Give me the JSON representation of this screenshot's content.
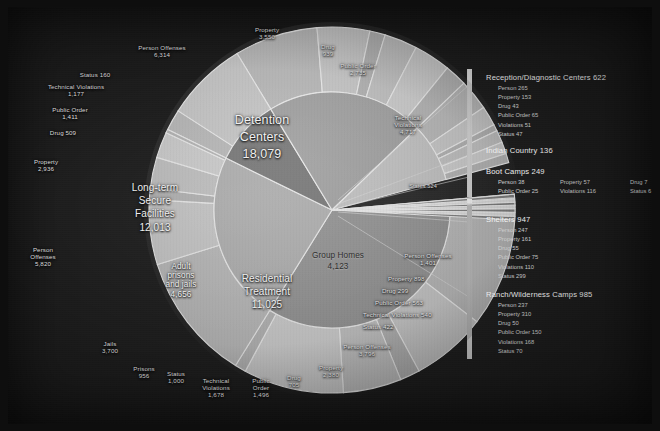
{
  "chart_data": {
    "type": "pie",
    "title": "",
    "subtitle": "",
    "layout": "nested donut: inner ring = facility type, outer ring = offense breakdown",
    "legend_position": "right",
    "grid": false,
    "inner_ring": [
      {
        "label": "Detention Centers",
        "value": 18079,
        "value_text": "18,079",
        "color": "#8d8d8d"
      },
      {
        "label": "Long-term Secure Facilities",
        "value": 12013,
        "value_text": "12,013",
        "color": "#a9a9a9"
      },
      {
        "label": "Adult prisons and jails",
        "value": 4656,
        "value_text": "4,656",
        "color": "#6f6f6f"
      },
      {
        "label": "Residential Treatment",
        "value": 11025,
        "value_text": "11,025",
        "color": "#9b9b9b"
      },
      {
        "label": "Group Homes",
        "value": 4123,
        "value_text": "4,123",
        "color": "#bdbdbd"
      }
    ],
    "outer_ring": [
      {
        "label": "Person Offenses",
        "value": 6314,
        "value_text": "6,314",
        "parent": "Detention Centers"
      },
      {
        "label": "Property",
        "value": 3550,
        "value_text": "3,550",
        "parent": "Detention Centers"
      },
      {
        "label": "Drug",
        "value": 939,
        "value_text": "939",
        "parent": "Detention Centers"
      },
      {
        "label": "Public Order",
        "value": 2735,
        "value_text": "2,735",
        "parent": "Detention Centers"
      },
      {
        "label": "Technical Violations",
        "value": 4717,
        "value_text": "4,717",
        "parent": "Detention Centers"
      },
      {
        "label": "Status",
        "value": 524,
        "value_text": "524",
        "parent": "Detention Centers"
      },
      {
        "label": "Person Offenses",
        "value": 1401,
        "value_text": "1,401",
        "parent": "Group Homes"
      },
      {
        "label": "Property",
        "value": 898,
        "value_text": "898",
        "parent": "Group Homes"
      },
      {
        "label": "Drug",
        "value": 299,
        "value_text": "299",
        "parent": "Group Homes"
      },
      {
        "label": "Public Order",
        "value": 563,
        "value_text": "563",
        "parent": "Group Homes"
      },
      {
        "label": "Technical Violations",
        "value": 540,
        "value_text": "540",
        "parent": "Group Homes"
      },
      {
        "label": "Status",
        "value": 422,
        "value_text": "422",
        "parent": "Group Homes"
      },
      {
        "label": "Person Offenses",
        "value": 3796,
        "value_text": "3,796",
        "parent": "Residential Treatment"
      },
      {
        "label": "Property",
        "value": 2380,
        "value_text": "2,380",
        "parent": "Residential Treatment"
      },
      {
        "label": "Drug",
        "value": 705,
        "value_text": "705",
        "parent": "Residential Treatment"
      },
      {
        "label": "Public Order",
        "value": 1496,
        "value_text": "1,496",
        "parent": "Residential Treatment"
      },
      {
        "label": "Technical Violations",
        "value": 1678,
        "value_text": "1,678",
        "parent": "Residential Treatment"
      },
      {
        "label": "Status",
        "value": 1000,
        "value_text": "1,000",
        "parent": "Residential Treatment"
      },
      {
        "label": "Prisons",
        "value": 956,
        "value_text": "956",
        "parent": "Adult prisons and jails"
      },
      {
        "label": "Jails",
        "value": 3700,
        "value_text": "3,700",
        "parent": "Adult prisons and jails"
      },
      {
        "label": "Person Offenses",
        "value": 5820,
        "value_text": "5,820",
        "parent": "Long-term Secure Facilities"
      },
      {
        "label": "Property",
        "value": 2936,
        "value_text": "2,936",
        "parent": "Long-term Secure Facilities"
      },
      {
        "label": "Drug",
        "value": 509,
        "value_text": "509",
        "parent": "Long-term Secure Facilities"
      },
      {
        "label": "Public Order",
        "value": 1411,
        "value_text": "1,411",
        "parent": "Long-term Secure Facilities"
      },
      {
        "label": "Technical Violations",
        "value": 1177,
        "value_text": "1,177",
        "parent": "Long-term Secure Facilities"
      },
      {
        "label": "Status",
        "value": 160,
        "value_text": "160",
        "parent": "Long-term Secure Facilities"
      }
    ],
    "callout_groups": [
      {
        "title": "Reception/Diagnostic Centers 622",
        "items": [
          "Person 265",
          "Property 153",
          "Drug 43",
          "Public Order 65",
          "Violations 51",
          "Status 47"
        ],
        "columns": 1
      },
      {
        "title": "Indian Country 136",
        "items": [],
        "columns": 0
      },
      {
        "title": "Boot Camps 249",
        "items": [
          "Person 38",
          "Property 57",
          "Drug 7",
          "Public Order 25",
          "Violations 116",
          "Status 6"
        ],
        "columns": 3
      },
      {
        "title": "Shelters 947",
        "items": [
          "Person 247",
          "Property 161",
          "Drug 55",
          "Public Order 75",
          "Violations 110",
          "Status 299"
        ],
        "columns": 1
      },
      {
        "title": "Ranch/Wilderness Camps 985",
        "items": [
          "Person 237",
          "Property 310",
          "Drug 50",
          "Public Order 150",
          "Violations 168",
          "Status 70"
        ],
        "columns": 1
      }
    ]
  },
  "center_labels": {
    "detention": {
      "l1": "Detention",
      "l2": "Centers",
      "l3": "18,079"
    },
    "longterm": {
      "l1": "Long-term",
      "l2": "Secure",
      "l3": "Facilities",
      "l4": "12,013"
    },
    "adult": {
      "l1": "Adult",
      "l2": "prisons",
      "l3": "and jails",
      "l4": "4,656"
    },
    "residential": {
      "l1": "Residential",
      "l2": "Treatment",
      "l3": "11,025"
    },
    "group": {
      "l1": "Group Homes",
      "l2": "4,123"
    }
  },
  "outer_labels": {
    "dc_person": {
      "l1": "Person Offenses",
      "l2": "6,314"
    },
    "dc_property": {
      "l1": "Property",
      "l2": "3,550"
    },
    "dc_drug": {
      "l1": "Drug",
      "l2": "939"
    },
    "dc_public": {
      "l1": "Public Order",
      "l2": "2,735"
    },
    "dc_tech": {
      "l1": "Technical",
      "l2": "Violations",
      "l3": "4,717"
    },
    "dc_status": {
      "l1": "Status 524"
    },
    "lt_status": {
      "l1": "Status 160"
    },
    "lt_tech": {
      "l1": "Technical Violations",
      "l2": "1,177"
    },
    "lt_public": {
      "l1": "Public Order",
      "l2": "1,411"
    },
    "lt_drug": {
      "l1": "Drug 509"
    },
    "lt_property": {
      "l1": "Property",
      "l2": "2,936"
    },
    "lt_person": {
      "l1": "Person",
      "l2": "Offenses",
      "l3": "5,820"
    },
    "ap_jails": {
      "l1": "Jails",
      "l2": "3,700"
    },
    "ap_prisons": {
      "l1": "Prisons",
      "l2": "956"
    },
    "rt_status": {
      "l1": "Status",
      "l2": "1,000"
    },
    "rt_tech": {
      "l1": "Technical",
      "l2": "Violations",
      "l3": "1,678"
    },
    "rt_public": {
      "l1": "Public",
      "l2": "Order",
      "l3": "1,496"
    },
    "rt_drug": {
      "l1": "Drug",
      "l2": "705"
    },
    "rt_property": {
      "l1": "Property",
      "l2": "2,380"
    },
    "rt_person": {
      "l1": "Person Offenses",
      "l2": "3,796"
    },
    "gh_person": {
      "l1": "Person Offenses",
      "l2": "1,401"
    },
    "gh_property": {
      "l1": "Property 898"
    },
    "gh_drug": {
      "l1": "Drug 299"
    },
    "gh_public": {
      "l1": "Public Order 563"
    },
    "gh_tech": {
      "l1": "Technical Violations 540"
    },
    "gh_status": {
      "l1": "Status 422"
    }
  }
}
